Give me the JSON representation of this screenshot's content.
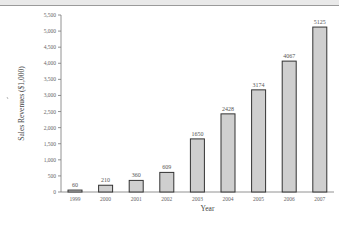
{
  "chart_data": {
    "type": "bar",
    "title": "",
    "xlabel": "Year",
    "ylabel": "Sales Revenues ($1,000)",
    "categories": [
      "1999",
      "2000",
      "2001",
      "2002",
      "2003",
      "2004",
      "2005",
      "2006",
      "2007"
    ],
    "values": [
      60,
      210,
      360,
      609,
      1650,
      2428,
      3174,
      4067,
      5125
    ],
    "data_labels": [
      "60",
      "210",
      "360",
      "609",
      "1650",
      "2428",
      "3174",
      "4067",
      "5125"
    ],
    "ylim": [
      0,
      5500
    ],
    "yticks": [
      0,
      500,
      1000,
      1500,
      2000,
      2500,
      3000,
      3500,
      4000,
      4500,
      5000,
      5500
    ],
    "ytick_labels": [
      "0",
      "500",
      "1,000",
      "1,500",
      "2,000",
      "2,500",
      "3,000",
      "3,500",
      "4,000",
      "4,500",
      "5,000",
      "5,500"
    ],
    "grid": false,
    "legend": null,
    "bar_fill": "#cfcfcf",
    "bar_stroke": "#333333"
  }
}
